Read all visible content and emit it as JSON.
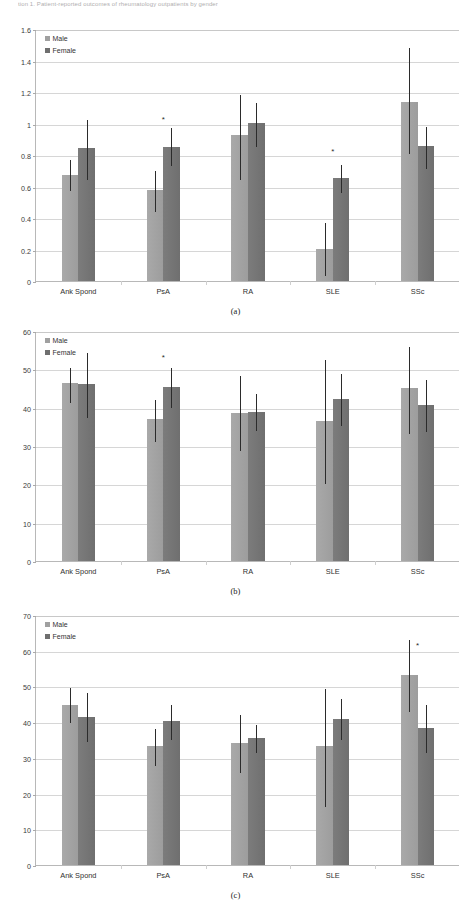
{
  "figure": {
    "top_caption": "tion 1. Patient-reported outcomes of rheumatology outpatients by gender",
    "legend": {
      "male": "Male",
      "female": "Female"
    },
    "significance_marker": "*"
  },
  "chart_data": [
    {
      "id": "a",
      "type": "bar",
      "caption": "(a)",
      "title": "",
      "xlabel": "",
      "ylabel": "",
      "ylim": [
        0,
        1.6
      ],
      "ytick_step": 0.2,
      "yticks": [
        "0",
        "0.2",
        "0.4",
        "0.6",
        "0.8",
        "1",
        "1.2",
        "1.4",
        "1.6"
      ],
      "grid": true,
      "legend_position": "top-left",
      "categories": [
        "Ank Spond",
        "PsA",
        "RA",
        "SLE",
        "SSc"
      ],
      "series": [
        {
          "name": "Male",
          "color": "#a0a0a0",
          "values": [
            0.675,
            0.575,
            0.925,
            0.205,
            1.135
          ],
          "err_low": [
            0.575,
            0.445,
            0.645,
            0.035,
            0.815
          ],
          "err_high": [
            0.775,
            0.705,
            1.185,
            0.375,
            1.485
          ]
        },
        {
          "name": "Female",
          "color": "#6f6f6f",
          "values": [
            0.845,
            0.85,
            1.005,
            0.655,
            0.855
          ],
          "err_low": [
            0.645,
            0.735,
            0.855,
            0.565,
            0.715
          ],
          "err_high": [
            1.03,
            0.98,
            1.135,
            0.74,
            0.985
          ]
        }
      ],
      "annotations": [
        {
          "category": "PsA",
          "label": "*",
          "y": 1.045
        },
        {
          "category": "SLE",
          "label": "*",
          "y": 0.845
        }
      ]
    },
    {
      "id": "b",
      "type": "bar",
      "caption": "(b)",
      "title": "",
      "xlabel": "",
      "ylabel": "",
      "ylim": [
        0,
        60
      ],
      "ytick_step": 10,
      "yticks": [
        "0",
        "10",
        "20",
        "30",
        "40",
        "50",
        "60"
      ],
      "grid": true,
      "legend_position": "top-left",
      "categories": [
        "Ank Spond",
        "PsA",
        "RA",
        "SLE",
        "SSc"
      ],
      "series": [
        {
          "name": "Male",
          "color": "#a0a0a0",
          "values": [
            46.5,
            37.1,
            38.7,
            36.5,
            45.2
          ],
          "err_low": [
            41.4,
            31.2,
            29.0,
            20.3,
            33.5
          ],
          "err_high": [
            50.6,
            42.3,
            48.4,
            52.8,
            56.0
          ]
        },
        {
          "name": "Female",
          "color": "#6f6f6f",
          "values": [
            46.1,
            45.3,
            39.0,
            42.3,
            40.7
          ],
          "err_low": [
            37.6,
            40.1,
            34.2,
            35.4,
            33.8
          ],
          "err_high": [
            54.5,
            50.6,
            43.8,
            49.0,
            47.5
          ]
        }
      ],
      "annotations": [
        {
          "category": "PsA",
          "label": "*",
          "y": 54.0
        }
      ]
    },
    {
      "id": "c",
      "type": "bar",
      "caption": "(c)",
      "title": "",
      "xlabel": "",
      "ylabel": "",
      "ylim": [
        0,
        70
      ],
      "ytick_step": 10,
      "yticks": [
        "0",
        "10",
        "20",
        "30",
        "40",
        "50",
        "60",
        "70"
      ],
      "grid": true,
      "legend_position": "top-left",
      "categories": [
        "Ank Spond",
        "PsA",
        "RA",
        "SLE",
        "SSc"
      ],
      "series": [
        {
          "name": "Male",
          "color": "#a0a0a0",
          "values": [
            44.9,
            33.3,
            34.2,
            33.2,
            53.2
          ],
          "err_low": [
            40.1,
            28.1,
            26.0,
            16.6,
            43.0
          ],
          "err_high": [
            49.8,
            38.4,
            42.3,
            49.6,
            63.4
          ]
        },
        {
          "name": "Female",
          "color": "#6f6f6f",
          "values": [
            41.4,
            40.2,
            35.5,
            41.0,
            38.4
          ],
          "err_low": [
            34.8,
            35.3,
            31.5,
            35.3,
            31.6
          ],
          "err_high": [
            48.4,
            45.2,
            39.5,
            46.7,
            45.1
          ]
        }
      ],
      "annotations": [
        {
          "category": "SSc",
          "label": "*",
          "y": 62.5
        }
      ]
    }
  ]
}
